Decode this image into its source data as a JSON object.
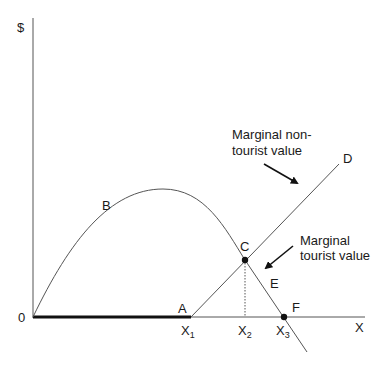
{
  "diagram": {
    "axes": {
      "y_label": "$",
      "x_label": "X",
      "origin_label": "0"
    },
    "points": {
      "A": "A",
      "B": "B",
      "C": "C",
      "D": "D",
      "E": "E",
      "F": "F"
    },
    "x_ticks": [
      {
        "base": "X",
        "sub": "1"
      },
      {
        "base": "X",
        "sub": "2"
      },
      {
        "base": "X",
        "sub": "3"
      }
    ],
    "annotations": {
      "non_tourist": [
        "Marginal non-",
        "tourist value"
      ],
      "tourist": [
        "Marginal",
        "tourist value"
      ]
    },
    "colors": {
      "line": "#555555",
      "thick": "#111111",
      "dot": "#111111"
    }
  }
}
